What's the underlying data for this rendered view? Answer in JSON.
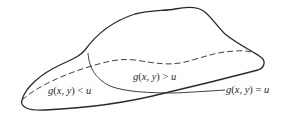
{
  "diagram": {
    "type": "region-boundary-sketch",
    "colors": {
      "ink": "#2a2a2a",
      "background": "#ffffff"
    },
    "labels": {
      "less_region": "g(x, y) < u",
      "greater_region": "g(x, y) > u",
      "level_curve": "g(x, y) = u"
    },
    "elements": [
      {
        "name": "outer-region-boundary",
        "style": "solid"
      },
      {
        "name": "hidden-edge",
        "style": "dashed"
      },
      {
        "name": "level-curve",
        "style": "solid",
        "label": "g(x, y) = u"
      }
    ]
  }
}
